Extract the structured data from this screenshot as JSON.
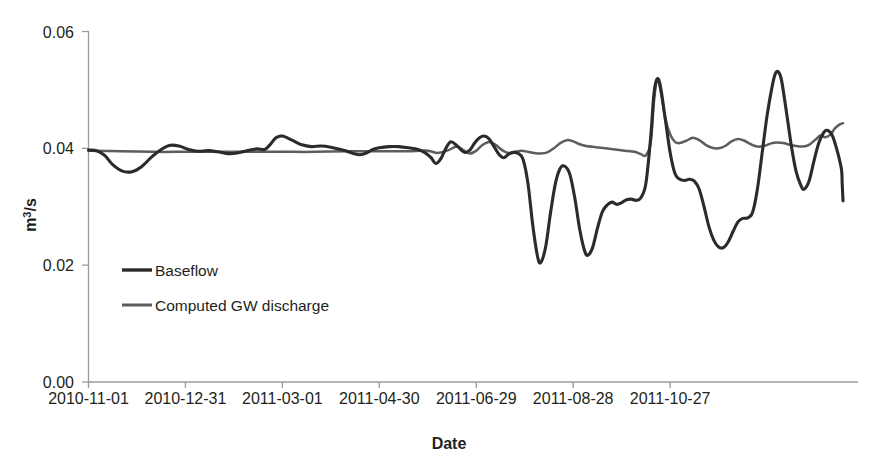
{
  "chart_data": {
    "type": "line",
    "title": "",
    "xlabel": "Date",
    "ylabel": "m3/s",
    "ylabel_display": "m",
    "ylabel_sup": "3",
    "ylabel_tail": "/s",
    "grid": false,
    "legend_position": "inside-left",
    "ylim": [
      0.0,
      0.06
    ],
    "yticks": [
      0.0,
      0.02,
      0.04,
      0.06
    ],
    "ytick_labels": [
      "0.00",
      "0.02",
      "0.04",
      "0.06"
    ],
    "xtick_labels": [
      "2010-11-01",
      "2010-12-31",
      "2011-03-01",
      "2011-04-30",
      "2011-06-29",
      "2011-08-28",
      "2011-10-27"
    ],
    "xlim": [
      "2010-11-01",
      "2011-11-02"
    ],
    "colors": {
      "baseflow": "#2b2b2b",
      "computed_gw_discharge": "#5d5d5d",
      "axis": "#9a9a9a",
      "text": "#231f20"
    },
    "series": [
      {
        "name": "Baseflow",
        "color": "#2b2b2b",
        "points": [
          [
            0,
            0.0397
          ],
          [
            5,
            0.0396
          ],
          [
            10,
            0.0388
          ],
          [
            15,
            0.0372
          ],
          [
            21,
            0.0361
          ],
          [
            27,
            0.036
          ],
          [
            33,
            0.0369
          ],
          [
            39,
            0.0385
          ],
          [
            45,
            0.0398
          ],
          [
            50,
            0.0405
          ],
          [
            56,
            0.0404
          ],
          [
            62,
            0.0398
          ],
          [
            68,
            0.0395
          ],
          [
            74,
            0.0396
          ],
          [
            80,
            0.0394
          ],
          [
            86,
            0.0391
          ],
          [
            92,
            0.0392
          ],
          [
            98,
            0.0396
          ],
          [
            104,
            0.0399
          ],
          [
            109,
            0.0398
          ],
          [
            112,
            0.0405
          ],
          [
            116,
            0.0418
          ],
          [
            120,
            0.0421
          ],
          [
            126,
            0.0414
          ],
          [
            132,
            0.0406
          ],
          [
            138,
            0.0403
          ],
          [
            144,
            0.0404
          ],
          [
            150,
            0.0402
          ],
          [
            156,
            0.0398
          ],
          [
            160,
            0.0395
          ],
          [
            164,
            0.0391
          ],
          [
            168,
            0.0389
          ],
          [
            172,
            0.0392
          ],
          [
            176,
            0.0398
          ],
          [
            180,
            0.0401
          ],
          [
            186,
            0.0403
          ],
          [
            192,
            0.0403
          ],
          [
            198,
            0.0401
          ],
          [
            204,
            0.0398
          ],
          [
            208,
            0.0393
          ],
          [
            212,
            0.0384
          ],
          [
            215,
            0.0374
          ],
          [
            218,
            0.0382
          ],
          [
            221,
            0.0399
          ],
          [
            224,
            0.0411
          ],
          [
            227,
            0.0407
          ],
          [
            230,
            0.0399
          ],
          [
            233,
            0.0393
          ],
          [
            236,
            0.0397
          ],
          [
            239,
            0.0409
          ],
          [
            242,
            0.0418
          ],
          [
            245,
            0.0421
          ],
          [
            248,
            0.0416
          ],
          [
            251,
            0.0403
          ],
          [
            254,
            0.039
          ],
          [
            257,
            0.0384
          ],
          [
            260,
            0.039
          ],
          [
            263,
            0.0393
          ],
          [
            266,
            0.0391
          ],
          [
            269,
            0.0381
          ],
          [
            272,
            0.034
          ],
          [
            275,
            0.0268
          ],
          [
            278,
            0.0214
          ],
          [
            280,
            0.0205
          ],
          [
            283,
            0.0232
          ],
          [
            286,
            0.029
          ],
          [
            289,
            0.034
          ],
          [
            292,
            0.0366
          ],
          [
            295,
            0.0369
          ],
          [
            298,
            0.0355
          ],
          [
            301,
            0.0315
          ],
          [
            304,
            0.0262
          ],
          [
            307,
            0.0225
          ],
          [
            309,
            0.0217
          ],
          [
            312,
            0.023
          ],
          [
            315,
            0.0263
          ],
          [
            318,
            0.0291
          ],
          [
            321,
            0.0303
          ],
          [
            324,
            0.0308
          ],
          [
            327,
            0.0304
          ],
          [
            330,
            0.0307
          ],
          [
            333,
            0.0312
          ],
          [
            336,
            0.0313
          ],
          [
            339,
            0.0311
          ],
          [
            342,
            0.0316
          ],
          [
            345,
            0.034
          ],
          [
            348,
            0.042
          ],
          [
            350,
            0.0494
          ],
          [
            352,
            0.0519
          ],
          [
            354,
            0.0506
          ],
          [
            357,
            0.045
          ],
          [
            360,
            0.0393
          ],
          [
            363,
            0.0357
          ],
          [
            366,
            0.0347
          ],
          [
            369,
            0.0345
          ],
          [
            372,
            0.0347
          ],
          [
            375,
            0.0344
          ],
          [
            378,
            0.033
          ],
          [
            381,
            0.03
          ],
          [
            384,
            0.0266
          ],
          [
            387,
            0.0243
          ],
          [
            390,
            0.0231
          ],
          [
            393,
            0.023
          ],
          [
            396,
            0.024
          ],
          [
            399,
            0.0258
          ],
          [
            402,
            0.0274
          ],
          [
            405,
            0.028
          ],
          [
            408,
            0.0281
          ],
          [
            411,
            0.029
          ],
          [
            414,
            0.033
          ],
          [
            417,
            0.0393
          ],
          [
            420,
            0.0456
          ],
          [
            423,
            0.0504
          ],
          [
            425,
            0.0527
          ],
          [
            427,
            0.0531
          ],
          [
            429,
            0.0516
          ],
          [
            432,
            0.0462
          ],
          [
            435,
            0.0405
          ],
          [
            438,
            0.036
          ],
          [
            441,
            0.0336
          ],
          [
            443,
            0.033
          ],
          [
            446,
            0.0344
          ],
          [
            449,
            0.0378
          ],
          [
            452,
            0.0409
          ],
          [
            455,
            0.0427
          ],
          [
            457,
            0.0431
          ],
          [
            460,
            0.0424
          ],
          [
            463,
            0.04
          ],
          [
            466,
            0.0365
          ],
          [
            466.5,
            0.034
          ],
          [
            467,
            0.031
          ]
        ]
      },
      {
        "name": "Computed GW discharge",
        "color": "#5d5d5d",
        "points": [
          [
            0,
            0.0396
          ],
          [
            20,
            0.0395
          ],
          [
            40,
            0.0394
          ],
          [
            60,
            0.0394
          ],
          [
            80,
            0.0394
          ],
          [
            100,
            0.0394
          ],
          [
            120,
            0.0394
          ],
          [
            140,
            0.0394
          ],
          [
            160,
            0.0395
          ],
          [
            180,
            0.0395
          ],
          [
            200,
            0.0395
          ],
          [
            210,
            0.0396
          ],
          [
            216,
            0.0392
          ],
          [
            222,
            0.0396
          ],
          [
            228,
            0.0403
          ],
          [
            232,
            0.0397
          ],
          [
            236,
            0.0391
          ],
          [
            240,
            0.0396
          ],
          [
            244,
            0.0406
          ],
          [
            248,
            0.0411
          ],
          [
            252,
            0.0406
          ],
          [
            256,
            0.0397
          ],
          [
            260,
            0.0392
          ],
          [
            264,
            0.0394
          ],
          [
            268,
            0.0396
          ],
          [
            272,
            0.0394
          ],
          [
            276,
            0.0392
          ],
          [
            280,
            0.0391
          ],
          [
            284,
            0.0393
          ],
          [
            288,
            0.04
          ],
          [
            292,
            0.0409
          ],
          [
            296,
            0.0414
          ],
          [
            300,
            0.0412
          ],
          [
            304,
            0.0407
          ],
          [
            308,
            0.0404
          ],
          [
            314,
            0.0402
          ],
          [
            320,
            0.04
          ],
          [
            326,
            0.0398
          ],
          [
            332,
            0.0396
          ],
          [
            338,
            0.0394
          ],
          [
            342,
            0.039
          ],
          [
            345,
            0.0388
          ],
          [
            348,
            0.041
          ],
          [
            350,
            0.048
          ],
          [
            352,
            0.0518
          ],
          [
            354,
            0.05
          ],
          [
            357,
            0.0452
          ],
          [
            360,
            0.0424
          ],
          [
            363,
            0.0411
          ],
          [
            366,
            0.0409
          ],
          [
            370,
            0.0413
          ],
          [
            374,
            0.0418
          ],
          [
            378,
            0.0414
          ],
          [
            382,
            0.0406
          ],
          [
            386,
            0.0401
          ],
          [
            390,
            0.04
          ],
          [
            394,
            0.0404
          ],
          [
            398,
            0.0412
          ],
          [
            402,
            0.0416
          ],
          [
            406,
            0.0413
          ],
          [
            410,
            0.0407
          ],
          [
            414,
            0.0403
          ],
          [
            418,
            0.0404
          ],
          [
            422,
            0.0408
          ],
          [
            426,
            0.041
          ],
          [
            430,
            0.0409
          ],
          [
            434,
            0.0406
          ],
          [
            438,
            0.0404
          ],
          [
            442,
            0.0403
          ],
          [
            446,
            0.0406
          ],
          [
            450,
            0.0415
          ],
          [
            453,
            0.0422
          ],
          [
            456,
            0.0419
          ],
          [
            459,
            0.0423
          ],
          [
            462,
            0.0434
          ],
          [
            465,
            0.0441
          ],
          [
            467,
            0.0443
          ]
        ]
      }
    ],
    "legend": [
      {
        "label": "Baseflow",
        "color": "#2b2b2b"
      },
      {
        "label": "Computed GW discharge",
        "color": "#5d5d5d"
      }
    ]
  }
}
